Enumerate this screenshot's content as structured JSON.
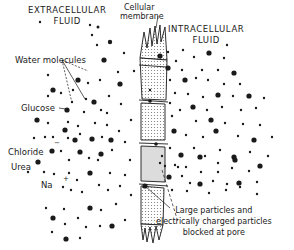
{
  "diagram": {
    "regions": {
      "extracellular": {
        "line1": "EXTRACELLULAR",
        "line2": "FLUID"
      },
      "intracellular": {
        "line1": "INTRACELLULAR",
        "line2": "FLUID"
      },
      "membrane": {
        "line1": "Cellular",
        "line2": "membrane"
      }
    },
    "labels": {
      "water": "Water molecules",
      "glucose": "Glucose",
      "chloride": "Chloride",
      "chloride_charge": "−",
      "urea": "Urea",
      "sodium": "Na",
      "sodium_charge": "+",
      "blocked": {
        "line1": "Large particles and",
        "line2": "electrically charged particles",
        "line3": "blocked at pore"
      }
    },
    "colors": {
      "ink": "#1a1a1a",
      "membrane_fill": "#d9d9d9",
      "background": "#ffffff"
    }
  }
}
